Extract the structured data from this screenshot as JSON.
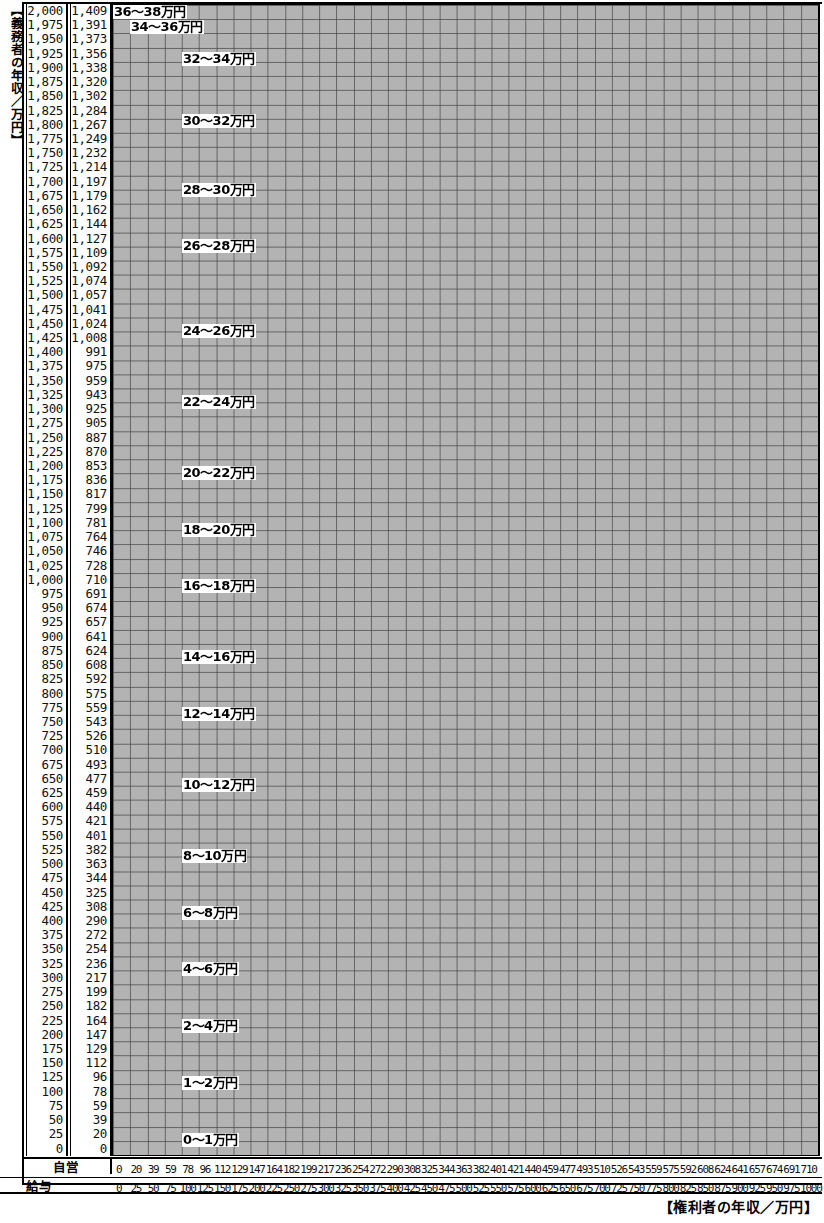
{
  "axes": {
    "y_caption": "【義務者の年収／万円】",
    "x_caption": "【権利者の年収／万円】",
    "y_col1_name": "給与",
    "y_col2_name": "自営",
    "x_row1_name": "自営",
    "x_row2_name": "給与",
    "y_salary": [
      "2,000",
      "1,975",
      "1,950",
      "1,925",
      "1,900",
      "1,875",
      "1,850",
      "1,825",
      "1,800",
      "1,775",
      "1,750",
      "1,725",
      "1,700",
      "1,675",
      "1,650",
      "1,625",
      "1,600",
      "1,575",
      "1,550",
      "1,525",
      "1,500",
      "1,475",
      "1,450",
      "1,425",
      "1,400",
      "1,375",
      "1,350",
      "1,325",
      "1,300",
      "1,275",
      "1,250",
      "1,225",
      "1,200",
      "1,175",
      "1,150",
      "1,125",
      "1,100",
      "1,075",
      "1,050",
      "1,025",
      "1,000",
      "975",
      "950",
      "925",
      "900",
      "875",
      "850",
      "825",
      "800",
      "775",
      "750",
      "725",
      "700",
      "675",
      "650",
      "625",
      "600",
      "575",
      "550",
      "525",
      "500",
      "475",
      "450",
      "425",
      "400",
      "375",
      "350",
      "325",
      "300",
      "275",
      "250",
      "225",
      "200",
      "175",
      "150",
      "125",
      "100",
      "75",
      "50",
      "25",
      "0"
    ],
    "y_self": [
      "1,409",
      "1,391",
      "1,373",
      "1,356",
      "1,338",
      "1,320",
      "1,302",
      "1,284",
      "1,267",
      "1,249",
      "1,232",
      "1,214",
      "1,197",
      "1,179",
      "1,162",
      "1,144",
      "1,127",
      "1,109",
      "1,092",
      "1,074",
      "1,057",
      "1,041",
      "1,024",
      "1,008",
      "991",
      "975",
      "959",
      "943",
      "925",
      "905",
      "887",
      "870",
      "853",
      "836",
      "817",
      "799",
      "781",
      "764",
      "746",
      "728",
      "710",
      "691",
      "674",
      "657",
      "641",
      "624",
      "608",
      "592",
      "575",
      "559",
      "543",
      "526",
      "510",
      "493",
      "477",
      "459",
      "440",
      "421",
      "401",
      "382",
      "363",
      "344",
      "325",
      "308",
      "290",
      "272",
      "254",
      "236",
      "217",
      "199",
      "182",
      "164",
      "147",
      "129",
      "112",
      "96",
      "78",
      "59",
      "39",
      "20",
      "0"
    ],
    "x_self": [
      "0",
      "20",
      "39",
      "59",
      "78",
      "96",
      "112",
      "129",
      "147",
      "164",
      "182",
      "199",
      "217",
      "236",
      "254",
      "272",
      "290",
      "308",
      "325",
      "344",
      "363",
      "382",
      "401",
      "421",
      "440",
      "459",
      "477",
      "493",
      "510",
      "526",
      "543",
      "559",
      "575",
      "592",
      "608",
      "624",
      "641",
      "657",
      "674",
      "691",
      "710"
    ],
    "x_salary": [
      "0",
      "25",
      "50",
      "75",
      "100",
      "125",
      "150",
      "175",
      "200",
      "225",
      "250",
      "275",
      "300",
      "325",
      "350",
      "375",
      "400",
      "425",
      "450",
      "475",
      "500",
      "525",
      "550",
      "575",
      "600",
      "625",
      "650",
      "675",
      "700",
      "725",
      "750",
      "775",
      "800",
      "825",
      "850",
      "875",
      "900",
      "925",
      "950",
      "975",
      "1000"
    ]
  },
  "chart_data": {
    "type": "heatmap",
    "xlabel": "【権利者の年収／万円】",
    "ylabel": "【義務者の年収／万円】",
    "grid": true,
    "legend": "none",
    "cell_shading": [
      "white",
      "gray"
    ],
    "colors": {
      "shaded": "#b3b3b3",
      "unshaded": "#ffffff",
      "gridline": "#444444",
      "frame": "#000000"
    },
    "x_categories_self": [
      0,
      20,
      39,
      59,
      78,
      96,
      112,
      129,
      147,
      164,
      182,
      199,
      217,
      236,
      254,
      272,
      290,
      308,
      325,
      344,
      363,
      382,
      401,
      421,
      440,
      459,
      477,
      493,
      510,
      526,
      543,
      559,
      575,
      592,
      608,
      624,
      641,
      657,
      674,
      691,
      710
    ],
    "x_categories_salary": [
      0,
      25,
      50,
      75,
      100,
      125,
      150,
      175,
      200,
      225,
      250,
      275,
      300,
      325,
      350,
      375,
      400,
      425,
      450,
      475,
      500,
      525,
      550,
      575,
      600,
      625,
      650,
      675,
      700,
      725,
      750,
      775,
      800,
      825,
      850,
      875,
      900,
      925,
      950,
      975,
      1000
    ],
    "y_categories_salary": [
      2000,
      1975,
      1950,
      1925,
      1900,
      1875,
      1850,
      1825,
      1800,
      1775,
      1750,
      1725,
      1700,
      1675,
      1650,
      1625,
      1600,
      1575,
      1550,
      1525,
      1500,
      1475,
      1450,
      1425,
      1400,
      1375,
      1350,
      1325,
      1300,
      1275,
      1250,
      1225,
      1200,
      1175,
      1150,
      1125,
      1100,
      1075,
      1050,
      1025,
      1000,
      975,
      950,
      925,
      900,
      875,
      850,
      825,
      800,
      775,
      750,
      725,
      700,
      675,
      650,
      625,
      600,
      575,
      550,
      525,
      500,
      475,
      450,
      425,
      400,
      375,
      350,
      325,
      300,
      275,
      250,
      225,
      200,
      175,
      150,
      125,
      100,
      75,
      50,
      25,
      0
    ],
    "y_categories_self": [
      1409,
      1391,
      1373,
      1356,
      1338,
      1320,
      1302,
      1284,
      1267,
      1249,
      1232,
      1214,
      1197,
      1179,
      1162,
      1144,
      1127,
      1109,
      1092,
      1074,
      1057,
      1041,
      1024,
      1008,
      991,
      975,
      959,
      943,
      925,
      905,
      887,
      870,
      853,
      836,
      817,
      799,
      781,
      764,
      746,
      728,
      710,
      691,
      674,
      657,
      641,
      624,
      608,
      592,
      575,
      559,
      543,
      526,
      510,
      493,
      477,
      459,
      440,
      421,
      401,
      382,
      363,
      344,
      325,
      308,
      290,
      272,
      254,
      236,
      217,
      199,
      182,
      164,
      147,
      129,
      112,
      96,
      78,
      59,
      39,
      20,
      0
    ],
    "bands_note": "Diagonal bands: payment amount in 万円 decreases as obligee income rises and increases as obligor income rises.",
    "band_definitions": [
      {
        "label": "36～38万円",
        "level": 19,
        "y_intercept_row": 0.0
      },
      {
        "label": "34～36万円",
        "level": 18,
        "y_intercept_row": 1.2
      },
      {
        "label": "32～34万円",
        "level": 17,
        "y_intercept_row": 3.0
      },
      {
        "label": "30～32万円",
        "level": 16,
        "y_intercept_row": 8.0
      },
      {
        "label": "28～30万円",
        "level": 15,
        "y_intercept_row": 13.0
      },
      {
        "label": "26～28万円",
        "level": 14,
        "y_intercept_row": 17.5
      },
      {
        "label": "24～26万円",
        "level": 13,
        "y_intercept_row": 23.0
      },
      {
        "label": "22～24万円",
        "level": 12,
        "y_intercept_row": 28.0
      },
      {
        "label": "20～22万円",
        "level": 11,
        "y_intercept_row": 33.0
      },
      {
        "label": "18～20万円",
        "level": 10,
        "y_intercept_row": 37.5
      },
      {
        "label": "16～18万円",
        "level": 9,
        "y_intercept_row": 42.0
      },
      {
        "label": "14～16万円",
        "level": 8,
        "y_intercept_row": 47.0
      },
      {
        "label": "12～14万円",
        "level": 7,
        "y_intercept_row": 52.0
      },
      {
        "label": "10～12万円",
        "level": 6,
        "y_intercept_row": 57.0
      },
      {
        "label": "8～10万円",
        "level": 5,
        "y_intercept_row": 61.5
      },
      {
        "label": "6～8万円",
        "level": 4,
        "y_intercept_row": 66.0
      },
      {
        "label": "4～6万円",
        "level": 3,
        "y_intercept_row": 70.0
      },
      {
        "label": "2～4万円",
        "level": 2,
        "y_intercept_row": 74.0
      },
      {
        "label": "1～2万円",
        "level": 1,
        "y_intercept_row": 77.0
      },
      {
        "label": "0～1万円",
        "level": 0,
        "y_intercept_row": 79.5
      }
    ]
  },
  "band_labels": [
    {
      "text": "36～38万円",
      "left": 1,
      "top": 1
    },
    {
      "text": "34～36万円",
      "left": 18,
      "top": 16
    },
    {
      "text": "32～34万円",
      "left": 70,
      "top": 48
    },
    {
      "text": "30～32万円",
      "left": 70,
      "top": 110
    },
    {
      "text": "28～30万円",
      "left": 70,
      "top": 179
    },
    {
      "text": "26～28万円",
      "left": 70,
      "top": 235
    },
    {
      "text": "24～26万円",
      "left": 70,
      "top": 320
    },
    {
      "text": "22～24万円",
      "left": 70,
      "top": 391
    },
    {
      "text": "20～22万円",
      "left": 70,
      "top": 462
    },
    {
      "text": "18～20万円",
      "left": 70,
      "top": 519
    },
    {
      "text": "16～18万円",
      "left": 70,
      "top": 575
    },
    {
      "text": "14～16万円",
      "left": 70,
      "top": 646
    },
    {
      "text": "12～14万円",
      "left": 70,
      "top": 703
    },
    {
      "text": "10～12万円",
      "left": 70,
      "top": 774
    },
    {
      "text": "8～10万円",
      "left": 70,
      "top": 845
    },
    {
      "text": "6～8万円",
      "left": 70,
      "top": 902
    },
    {
      "text": "4～6万円",
      "left": 70,
      "top": 958
    },
    {
      "text": "2～4万円",
      "left": 70,
      "top": 1015
    },
    {
      "text": "1～2万円",
      "left": 70,
      "top": 1072
    },
    {
      "text": "0～1万円",
      "left": 70,
      "top": 1129
    }
  ]
}
